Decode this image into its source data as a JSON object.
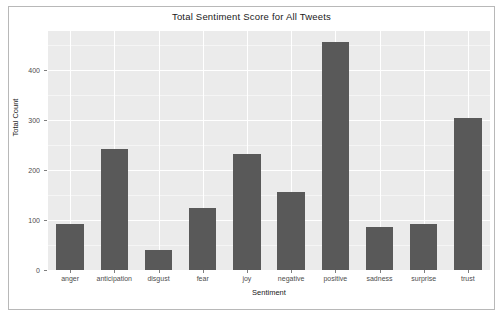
{
  "figure": {
    "title": "Total Sentiment Score for All Tweets",
    "panel_background": "#ebebeb",
    "bar_color": "#595959",
    "grid_color": "#ffffff",
    "border_color": "#b8b8b8"
  },
  "chart_data": {
    "type": "bar",
    "title": "Total Sentiment Score for All Tweets",
    "xlabel": "Sentiment",
    "ylabel": "Total Count",
    "categories": [
      "anger",
      "anticipation",
      "disgust",
      "fear",
      "joy",
      "negative",
      "positive",
      "sadness",
      "surprise",
      "trust"
    ],
    "values": [
      93,
      242,
      40,
      124,
      232,
      157,
      456,
      87,
      92,
      304
    ],
    "ylim": [
      0,
      478
    ],
    "yticks": [
      0,
      100,
      200,
      300,
      400
    ],
    "ytick_labels": [
      "0",
      "100",
      "200",
      "300",
      "400"
    ],
    "grid": true,
    "legend": null
  }
}
